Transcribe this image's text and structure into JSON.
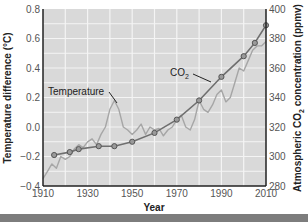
{
  "chart_data": {
    "type": "line",
    "title": "",
    "xlabel": "Year",
    "ylabel_left": "Temperature difference (°C)",
    "ylabel_right": "Atmospheric CO2 concentration (ppmv)",
    "xlim": [
      1910,
      2010
    ],
    "ylim_left": [
      -0.4,
      0.8
    ],
    "ylim_right": [
      280,
      400
    ],
    "x_ticks": [
      1910,
      1930,
      1950,
      1970,
      1990,
      2010
    ],
    "y_ticks_left": [
      -0.4,
      -0.2,
      0.0,
      0.2,
      0.4,
      0.6,
      0.8
    ],
    "y_ticks_right": [
      280,
      300,
      320,
      340,
      360,
      380,
      400
    ],
    "grid": true,
    "series": [
      {
        "name": "Temperature",
        "axis": "left",
        "style": "jagged light gray line",
        "x": [
          1910,
          1912,
          1914,
          1916,
          1918,
          1920,
          1922,
          1924,
          1926,
          1928,
          1930,
          1932,
          1934,
          1936,
          1938,
          1940,
          1942,
          1944,
          1946,
          1948,
          1950,
          1952,
          1954,
          1956,
          1958,
          1960,
          1962,
          1964,
          1966,
          1968,
          1970,
          1972,
          1974,
          1976,
          1978,
          1980,
          1982,
          1984,
          1986,
          1988,
          1990,
          1992,
          1994,
          1996,
          1998,
          2000,
          2002,
          2004,
          2006,
          2008,
          2010
        ],
        "values": [
          -0.35,
          -0.3,
          -0.25,
          -0.28,
          -0.2,
          -0.22,
          -0.2,
          -0.15,
          -0.12,
          -0.14,
          -0.1,
          -0.08,
          -0.12,
          -0.05,
          0.0,
          0.12,
          0.18,
          0.12,
          0.0,
          -0.02,
          -0.05,
          -0.02,
          0.02,
          -0.05,
          0.0,
          -0.02,
          -0.01,
          -0.06,
          -0.02,
          0.0,
          0.05,
          0.08,
          0.0,
          -0.02,
          0.05,
          0.18,
          0.12,
          0.1,
          0.15,
          0.22,
          0.25,
          0.17,
          0.2,
          0.3,
          0.4,
          0.38,
          0.45,
          0.52,
          0.55,
          0.55,
          0.58
        ]
      },
      {
        "name": "CO2",
        "axis": "right",
        "style": "dark gray line with circle markers",
        "x": [
          1915,
          1922,
          1926,
          1935,
          1942,
          1950,
          1960,
          1970,
          1980,
          1990,
          2000,
          2005,
          2010
        ],
        "values": [
          301,
          303,
          305,
          307,
          307,
          310,
          316,
          325,
          338,
          354,
          368,
          377,
          389
        ]
      }
    ],
    "annotations": [
      {
        "text": "Temperature",
        "target_series": "Temperature"
      },
      {
        "text": "CO2",
        "target_series": "CO2"
      }
    ]
  },
  "labels": {
    "xlabel": "Year",
    "ylabel_left": "Temperature difference (°C)",
    "ylabel_right_pre": "Atmospheric CO",
    "ylabel_right_sub": "2",
    "ylabel_right_post": " concentration (ppmv)",
    "ann_temp": "Temperature",
    "ann_co2": "CO",
    "ann_co2_sub": "2"
  }
}
